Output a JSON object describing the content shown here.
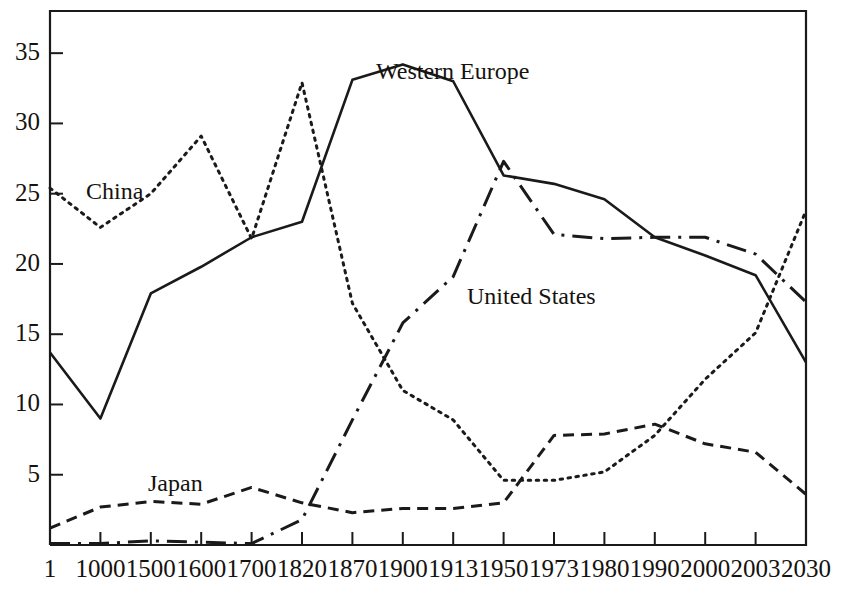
{
  "chart_data": {
    "type": "line",
    "title": "",
    "xlabel": "",
    "ylabel": "",
    "categories": [
      "1",
      "1000",
      "1500",
      "1600",
      "1700",
      "1820",
      "1870",
      "1900",
      "1913",
      "1950",
      "1973",
      "1980",
      "1990",
      "2000",
      "2003",
      "2030"
    ],
    "ylim": [
      0,
      38
    ],
    "yticks": [
      5,
      10,
      15,
      20,
      25,
      30,
      35
    ],
    "grid": false,
    "legend_position": "inline-annotations",
    "series": [
      {
        "name": "Western Europe",
        "style": "solid",
        "values": [
          13.7,
          9.0,
          17.9,
          19.8,
          21.9,
          23.0,
          33.1,
          34.2,
          33.0,
          26.3,
          25.7,
          24.6,
          21.9,
          20.6,
          19.2,
          13.0
        ]
      },
      {
        "name": "China",
        "style": "dotted",
        "values": [
          25.4,
          22.6,
          25.0,
          29.1,
          21.8,
          32.9,
          17.2,
          11.0,
          8.9,
          4.6,
          4.6,
          5.2,
          7.8,
          11.8,
          15.1,
          23.8
        ]
      },
      {
        "name": "United States",
        "style": "dash-dot",
        "values": [
          0.1,
          0.1,
          0.3,
          0.2,
          0.1,
          1.8,
          8.9,
          15.8,
          19.1,
          27.3,
          22.1,
          21.8,
          21.9,
          21.9,
          20.7,
          17.3
        ]
      },
      {
        "name": "Japan",
        "style": "dashed",
        "values": [
          1.2,
          2.7,
          3.1,
          2.9,
          4.1,
          3.0,
          2.3,
          2.6,
          2.6,
          3.0,
          7.8,
          7.9,
          8.6,
          7.2,
          6.6,
          3.6
        ]
      }
    ],
    "annotations": [
      {
        "text": "Western Europe",
        "x": 376,
        "y": 58
      },
      {
        "text": "China",
        "x": 86,
        "y": 178
      },
      {
        "text": "United States",
        "x": 467,
        "y": 283
      },
      {
        "text": "Japan",
        "x": 148,
        "y": 470
      }
    ]
  },
  "axis": {
    "y_labels": [
      "35",
      "30",
      "25",
      "20",
      "15",
      "10",
      "5"
    ],
    "x_labels": [
      "1",
      "1000",
      "1500",
      "1600",
      "1700",
      "1820",
      "1870",
      "1900",
      "1913",
      "1950",
      "1973",
      "1980",
      "1990",
      "2000",
      "2003",
      "2030"
    ]
  },
  "colors": {
    "line": "#1a1a1a",
    "axis": "#1a1a1a",
    "background": "#ffffff"
  }
}
